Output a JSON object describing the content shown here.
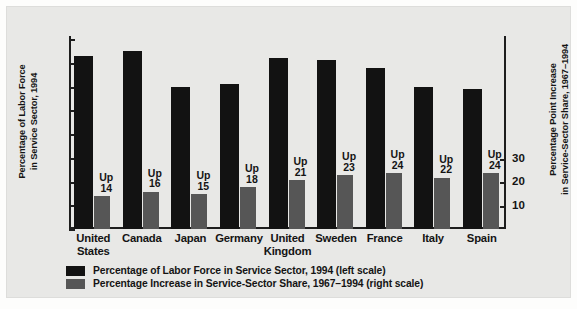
{
  "chart_data": {
    "type": "bar",
    "title": "",
    "categories": [
      "United\nStates",
      "Canada",
      "Japan",
      "Germany",
      "United\nKingdom",
      "Sweden",
      "France",
      "Italy",
      "Spain"
    ],
    "series": [
      {
        "name": "Percentage of Labor Force in Service Sector, 1994",
        "scale": "left",
        "color": "#121212",
        "values": [
          73,
          75,
          60,
          61,
          72,
          71,
          68,
          60,
          59
        ]
      },
      {
        "name": "Percentage Increase in Service-Sector Share, 1967-1994",
        "scale": "right",
        "color": "#565656",
        "values": [
          14,
          16,
          15,
          18,
          21,
          23,
          24,
          22,
          24
        ]
      }
    ],
    "point_labels": [
      "Up\n14",
      "Up\n16",
      "Up\n15",
      "Up\n18",
      "Up\n21",
      "Up\n23",
      "Up\n24",
      "Up\n22",
      "Up\n24"
    ],
    "left_axis": {
      "label": "Percentage of Labor Force\nin Service Sector, 1994",
      "ticks": [
        0,
        10,
        20,
        30,
        40,
        50,
        60,
        70,
        80
      ],
      "ylim": [
        0,
        85
      ]
    },
    "right_axis": {
      "label": "Percentage Point Increase\nin Service-Sector Share, 1967–1994",
      "ticks": [
        10,
        20,
        30
      ],
      "ylim": [
        0,
        51
      ]
    },
    "xlabel": "",
    "grid": false,
    "legend_position": "bottom-left"
  },
  "legend": {
    "items": [
      {
        "label": "Percentage of Labor Force in Service Sector, 1994",
        "scale_note": " (left scale)",
        "swatch": "primary"
      },
      {
        "label": "Percentage Increase in Service-Sector Share, 1967–1994",
        "scale_note": " (right scale)",
        "swatch": "secondary"
      }
    ]
  }
}
